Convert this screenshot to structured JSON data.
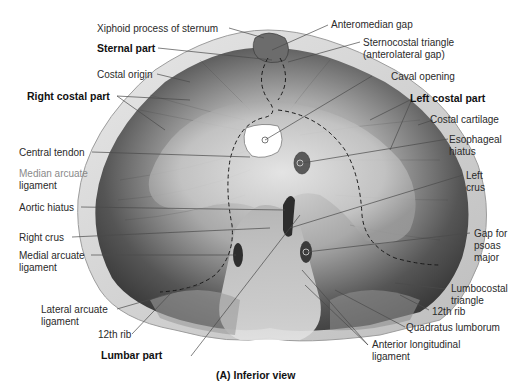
{
  "figure": {
    "caption": "(A) Inferior view",
    "colors": {
      "background": "#ffffff",
      "muscle_dark": "#3e3e3e",
      "muscle_mid": "#7a7a7a",
      "tendon_light": "#cfcfcf",
      "cartilage_rim": "#d9d9d9",
      "opening_white": "#ffffff",
      "leader_line": "#4a4a4a",
      "dashed_outline": "#1a1a1a"
    }
  },
  "labels": {
    "xiphoid": "Xiphoid process of sternum",
    "sternal_part": "Sternal part",
    "costal_origin": "Costal origin",
    "right_costal_part": "Right costal part",
    "central_tendon": "Central tendon",
    "median_arcuate_1": "Median arcuate",
    "median_arcuate_2": "ligament",
    "aortic_hiatus": "Aortic hiatus",
    "right_crus": "Right crus",
    "medial_arcuate_1": "Medial arcuate",
    "medial_arcuate_2": "ligament",
    "lateral_arcuate_1": "Lateral arcuate",
    "lateral_arcuate_2": "ligament",
    "twelfth_rib_left": "12th rib",
    "lumbar_part": "Lumbar part",
    "anteromedian_gap": "Anteromedian gap",
    "sternocostal_1": "Sternocostal triangle",
    "sternocostal_2": "(anterolateral gap)",
    "caval_opening": "Caval opening",
    "left_costal_part": "Left costal part",
    "costal_cartilage": "Costal cartilage",
    "esophageal_1": "Esophageal",
    "esophageal_2": "hiatus",
    "left_crus_1": "Left",
    "left_crus_2": "crus",
    "gap_psoas_1": "Gap for",
    "gap_psoas_2": "psoas",
    "gap_psoas_3": "major",
    "lumbocostal_1": "Lumbocostal",
    "lumbocostal_2": "triangle",
    "twelfth_rib_right": "12th rib",
    "quadratus": "Quadratus lumborum",
    "anterior_long_1": "Anterior longitudinal",
    "anterior_long_2": "ligament"
  }
}
